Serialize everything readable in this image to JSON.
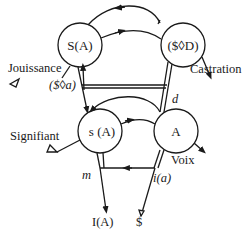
{
  "diagram": {
    "colors": {
      "ink": "#1a1a1a",
      "background": "#ffffff"
    },
    "nodes": [
      {
        "id": "SA",
        "label": "S(A)"
      },
      {
        "id": "SD",
        "label": "($◊D)"
      },
      {
        "id": "sA",
        "label": "s (A)"
      },
      {
        "id": "A",
        "label": "A"
      }
    ],
    "labels": {
      "jouissance": "Jouissance",
      "castration": "Castration",
      "fantasy": "($◊a)",
      "desire": "d",
      "signifiant": "Signifiant",
      "voix": "Voix",
      "ego": "m",
      "image": "i(a)",
      "ego_ideal": "I(A)",
      "subject": "$"
    },
    "edges": [
      {
        "from": "SD",
        "to": "SA",
        "kind": "upper arc"
      },
      {
        "from": "SA",
        "to": "SD",
        "kind": "upper vector"
      },
      {
        "from": "Jouissance",
        "to": "SA",
        "kind": "entry"
      },
      {
        "from": "SD",
        "to": "Castration",
        "kind": "exit"
      },
      {
        "from": "SA",
        "to": "sA",
        "kind": "descending"
      },
      {
        "from": "SD",
        "to": "A",
        "kind": "descending double"
      },
      {
        "from": "fantasy",
        "to": "desire",
        "kind": "horizontal"
      },
      {
        "from": "A",
        "to": "sA",
        "kind": "lower arc"
      },
      {
        "from": "sA",
        "to": "A",
        "kind": "lower vector"
      },
      {
        "from": "Signifiant",
        "to": "sA",
        "kind": "entry"
      },
      {
        "from": "A",
        "to": "Voix",
        "kind": "exit"
      },
      {
        "from": "image",
        "to": "ego",
        "kind": "imaginary"
      },
      {
        "from": "ego",
        "to": "ego_ideal",
        "kind": "descending"
      },
      {
        "from": "subject",
        "to": "image",
        "kind": "ascending"
      }
    ]
  }
}
